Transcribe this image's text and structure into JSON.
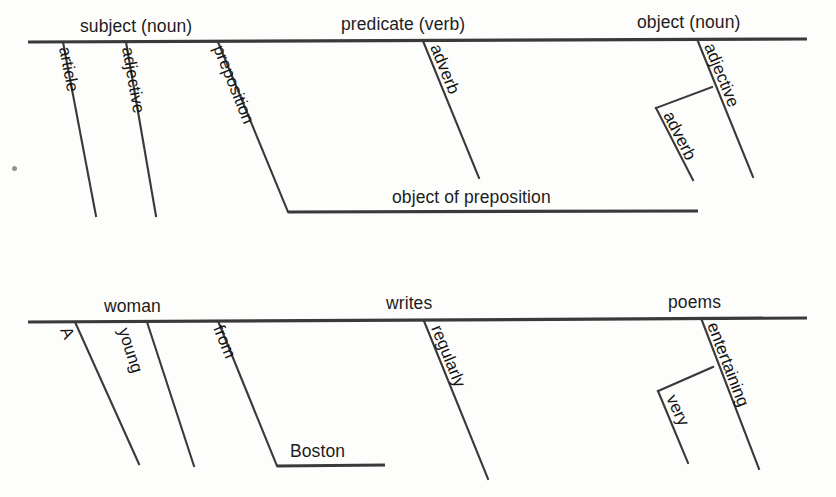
{
  "page": {
    "width": 836,
    "height": 497,
    "background_color": "#fdfdfc",
    "line_color": "#3a3a3a",
    "text_color": "#1c1c1c"
  },
  "diagrams": [
    {
      "id": "pattern-diagram",
      "name": "grammatical-pattern-diagram",
      "baseline": {
        "x1": 28,
        "y1": 42,
        "x2": 807,
        "y2": 39
      },
      "labels_on_baseline": [
        {
          "key": "subject",
          "text": "subject (noun)",
          "x": 80,
          "y": 32
        },
        {
          "key": "predicate",
          "text": "predicate (verb)",
          "x": 341,
          "y": 30
        },
        {
          "key": "object",
          "text": "object (noun)",
          "x": 637,
          "y": 28
        }
      ],
      "modifier_lines": [
        {
          "key": "article",
          "text": "article",
          "x1": 63,
          "y1": 42,
          "x2": 96,
          "y2": 216,
          "label_x": 59,
          "label_y": 48,
          "angle": 79
        },
        {
          "key": "adjective_subject",
          "text": "adjective",
          "x1": 126,
          "y1": 42,
          "x2": 156,
          "y2": 216,
          "label_x": 122,
          "label_y": 48,
          "angle": 80
        },
        {
          "key": "preposition",
          "text": "preposition",
          "x1": 218,
          "y1": 42,
          "x2": 288,
          "y2": 212,
          "label_x": 213,
          "label_y": 48,
          "angle": 68
        },
        {
          "key": "adverb_predicate",
          "text": "adverb",
          "x1": 423,
          "y1": 41,
          "x2": 479,
          "y2": 178,
          "label_x": 430,
          "label_y": 47,
          "angle": 68
        },
        {
          "key": "adjective_object",
          "text": "adjective",
          "x1": 697,
          "y1": 39,
          "x2": 753,
          "y2": 177,
          "label_x": 704,
          "label_y": 46,
          "angle": 68
        }
      ],
      "object_of_preposition": {
        "key": "object_of_preposition",
        "text": "object of preposition",
        "line": {
          "x1": 288,
          "y1": 212,
          "x2": 698,
          "y2": 211
        },
        "label_x": 392,
        "label_y": 203
      },
      "nested_adverb": {
        "key": "adverb_nested",
        "text": "adverb",
        "connector": {
          "x1": 712,
          "y1": 87,
          "x2": 656,
          "y2": 108
        },
        "stem": {
          "x1": 656,
          "y1": 108,
          "x2": 693,
          "y2": 180
        },
        "label_x": 663,
        "label_y": 115,
        "angle": 63
      }
    },
    {
      "id": "example-diagram",
      "name": "example-sentence-diagram",
      "sentence": "A young woman from Boston writes regularly very entertaining poems",
      "baseline": {
        "x1": 28,
        "y1": 322,
        "x2": 807,
        "y2": 318
      },
      "labels_on_baseline": [
        {
          "key": "subject_word",
          "text": "woman",
          "x": 104,
          "y": 312
        },
        {
          "key": "predicate_word",
          "text": "writes",
          "x": 386,
          "y": 309
        },
        {
          "key": "object_word",
          "text": "poems",
          "x": 668,
          "y": 308
        }
      ],
      "modifier_lines": [
        {
          "key": "article_word",
          "text": "A",
          "x1": 75,
          "y1": 322,
          "x2": 139,
          "y2": 464,
          "label_x": 60,
          "label_y": 330,
          "angle": 66
        },
        {
          "key": "adjective_subject_word",
          "text": "young",
          "x1": 147,
          "y1": 322,
          "x2": 194,
          "y2": 466,
          "label_x": 118,
          "label_y": 330,
          "angle": 72
        },
        {
          "key": "preposition_word",
          "text": "from",
          "x1": 218,
          "y1": 321,
          "x2": 277,
          "y2": 466,
          "label_x": 213,
          "label_y": 328,
          "angle": 68
        },
        {
          "key": "adverb_predicate_word",
          "text": "regularly",
          "x1": 424,
          "y1": 321,
          "x2": 488,
          "y2": 479,
          "label_x": 431,
          "label_y": 328,
          "angle": 68
        },
        {
          "key": "adjective_object_word",
          "text": "entertaining",
          "x1": 701,
          "y1": 318,
          "x2": 759,
          "y2": 469,
          "label_x": 707,
          "label_y": 325,
          "angle": 69
        }
      ],
      "object_of_preposition": {
        "key": "object_of_preposition_word",
        "text": "Boston",
        "line": {
          "x1": 277,
          "y1": 466,
          "x2": 385,
          "y2": 465
        },
        "label_x": 290,
        "label_y": 457
      },
      "nested_adverb": {
        "key": "adverb_nested_word",
        "text": "very",
        "connector": {
          "x1": 713,
          "y1": 367,
          "x2": 658,
          "y2": 391
        },
        "stem": {
          "x1": 658,
          "y1": 391,
          "x2": 688,
          "y2": 463
        },
        "label_x": 666,
        "label_y": 398,
        "angle": 65
      }
    }
  ],
  "artifacts": [
    {
      "key": "speck",
      "name": "scan-speck",
      "x": 12,
      "y": 166
    }
  ]
}
